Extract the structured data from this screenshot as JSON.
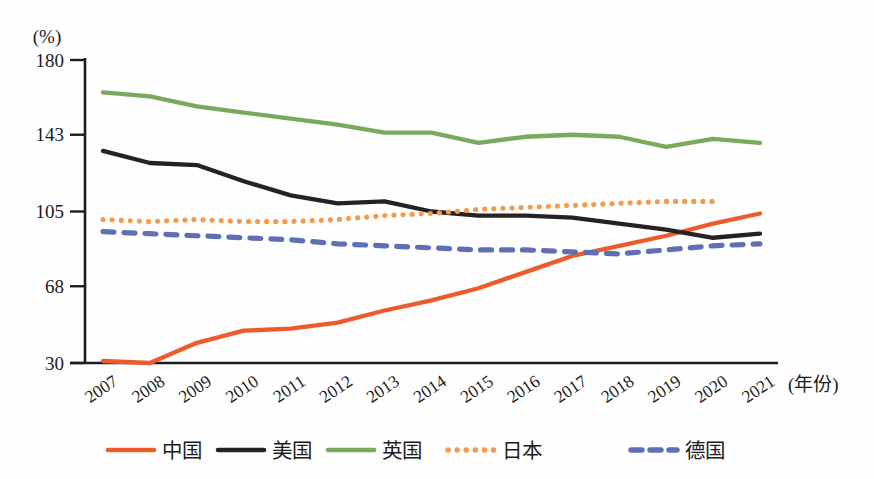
{
  "chart_data": {
    "type": "line",
    "title": "",
    "y_axis_unit_label": "(%)",
    "x_axis_unit_label": "(年份)",
    "yticks": [
      30,
      68,
      105,
      143,
      180
    ],
    "ylim": [
      30,
      180
    ],
    "grid": false,
    "legend_position": "bottom",
    "x": [
      2007,
      2008,
      2009,
      2010,
      2011,
      2012,
      2013,
      2014,
      2015,
      2016,
      2017,
      2018,
      2019,
      2020,
      2021
    ],
    "series": [
      {
        "name": "中国",
        "slug": "china",
        "color": "#ed5b2d",
        "style": "solid",
        "values": [
          31,
          30,
          40,
          46,
          47,
          50,
          56,
          61,
          67,
          75,
          83,
          88,
          93,
          99,
          104
        ]
      },
      {
        "name": "美国",
        "slug": "usa",
        "color": "#262222",
        "style": "solid",
        "values": [
          135,
          129,
          128,
          120,
          113,
          109,
          110,
          105,
          103,
          103,
          102,
          99,
          96,
          92,
          94
        ]
      },
      {
        "name": "英国",
        "slug": "uk",
        "color": "#7aa85c",
        "style": "solid",
        "values": [
          164,
          162,
          157,
          154,
          151,
          148,
          144,
          144,
          139,
          142,
          143,
          142,
          137,
          141,
          139
        ]
      },
      {
        "name": "日本",
        "slug": "japan",
        "color": "#f29a4e",
        "style": "dotted",
        "values": [
          101,
          100,
          101,
          100,
          100,
          101,
          103,
          104,
          106,
          107,
          108,
          109,
          110,
          110,
          null
        ]
      },
      {
        "name": "德国",
        "slug": "germany",
        "color": "#5e6fb5",
        "style": "dashed",
        "values": [
          95,
          94,
          93,
          92,
          91,
          89,
          88,
          87,
          86,
          86,
          85,
          84,
          86,
          88,
          89
        ]
      }
    ]
  }
}
